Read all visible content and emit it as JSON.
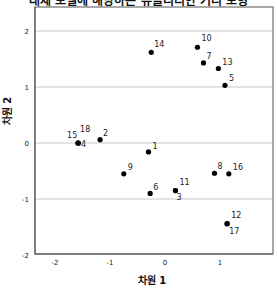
{
  "chart_data": {
    "type": "scatter",
    "title": "대체 모델에 해당하는 유클리디안 거리 모형",
    "xlabel": "차원 1",
    "ylabel": "차원 2",
    "xlim": [
      -2.55,
      1.95
    ],
    "ylim": [
      -2,
      2.45
    ],
    "xticks": [
      -2,
      -1,
      0,
      1
    ],
    "yticks": [
      -2,
      -1,
      0,
      1,
      2
    ],
    "grid": "horizontal",
    "legend": "none",
    "points": [
      {
        "label": "1",
        "x": -0.3,
        "y": -0.16,
        "lx": 4,
        "ly": -3
      },
      {
        "label": "2",
        "x": -1.18,
        "y": 0.06,
        "lx": 3,
        "ly": -4
      },
      {
        "label": "3",
        "x": 0.19,
        "y": -0.85,
        "lx": 1,
        "ly": 9
      },
      {
        "label": "4",
        "x": -1.58,
        "y": 0.0,
        "lx": 3,
        "ly": 4
      },
      {
        "label": "5",
        "x": 1.09,
        "y": 1.03,
        "lx": 4,
        "ly": -4
      },
      {
        "label": "6",
        "x": -0.27,
        "y": -0.9,
        "lx": 3,
        "ly": -3
      },
      {
        "label": "7",
        "x": 0.7,
        "y": 1.43,
        "lx": 3,
        "ly": -4
      },
      {
        "label": "8",
        "x": 0.9,
        "y": -0.54,
        "lx": 3,
        "ly": -4
      },
      {
        "label": "9",
        "x": -0.75,
        "y": -0.55,
        "lx": 4,
        "ly": -4
      },
      {
        "label": "10",
        "x": 0.59,
        "y": 1.71,
        "lx": 4,
        "ly": -6
      },
      {
        "label": "11",
        "x": 0.19,
        "y": -0.85,
        "lx": 4,
        "ly": -6
      },
      {
        "label": "12",
        "x": 1.13,
        "y": -1.44,
        "lx": 4,
        "ly": -6
      },
      {
        "label": "13",
        "x": 0.97,
        "y": 1.33,
        "lx": 4,
        "ly": -4
      },
      {
        "label": "14",
        "x": -0.25,
        "y": 1.62,
        "lx": 3,
        "ly": -5
      },
      {
        "label": "15",
        "x": -1.58,
        "y": 0.0,
        "lx": -11,
        "ly": -5
      },
      {
        "label": "16",
        "x": 1.16,
        "y": -0.55,
        "lx": 4,
        "ly": -4
      },
      {
        "label": "17",
        "x": 1.13,
        "y": -1.44,
        "lx": 2,
        "ly": 10
      },
      {
        "label": "18",
        "x": -1.58,
        "y": 0.0,
        "lx": 2,
        "ly": -11
      }
    ]
  }
}
